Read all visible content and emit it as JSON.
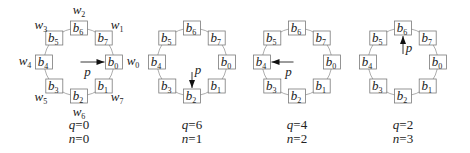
{
  "figure": {
    "box_prefix": "b",
    "outer_prefix": "w",
    "pointer_label": "p",
    "boxes": [
      {
        "index": "0",
        "angle": 0
      },
      {
        "index": "1",
        "angle": 45
      },
      {
        "index": "2",
        "angle": 90
      },
      {
        "index": "3",
        "angle": 135
      },
      {
        "index": "4",
        "angle": 180
      },
      {
        "index": "5",
        "angle": 225
      },
      {
        "index": "6",
        "angle": 270
      },
      {
        "index": "7",
        "angle": 315
      }
    ],
    "outer_labels": [
      {
        "index": "0",
        "angle": 0
      },
      {
        "index": "1",
        "angle": 315
      },
      {
        "index": "2",
        "angle": 270
      },
      {
        "index": "3",
        "angle": 225
      },
      {
        "index": "4",
        "angle": 180
      },
      {
        "index": "5",
        "angle": 135
      },
      {
        "index": "6",
        "angle": 90
      },
      {
        "index": "7",
        "angle": 45
      }
    ],
    "panels": [
      {
        "cx": 79,
        "q": "q=0",
        "n": "n=0",
        "pointer_to": 0,
        "show_outer": true
      },
      {
        "cx": 192,
        "q": "q=6",
        "n": "n=1",
        "pointer_to": 2,
        "show_outer": false
      },
      {
        "cx": 297,
        "q": "q=4",
        "n": "n=2",
        "pointer_to": 4,
        "show_outer": false
      },
      {
        "cx": 403,
        "q": "q=2",
        "n": "n=3",
        "pointer_to": 6,
        "show_outer": false
      }
    ]
  }
}
